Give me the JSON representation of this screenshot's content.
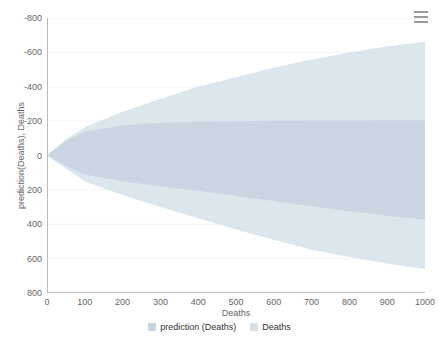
{
  "chart_data": {
    "type": "area",
    "title": "",
    "subtitle": "",
    "xlabel": "Deaths",
    "ylabel": "prediction(Deaths), Deaths",
    "xlim": [
      0,
      1000
    ],
    "ylim": [
      -800,
      800
    ],
    "x_ticks": [
      0,
      100,
      200,
      300,
      400,
      500,
      600,
      700,
      800,
      900,
      1000
    ],
    "y_ticks": [
      -800,
      -600,
      -400,
      -200,
      0,
      200,
      400,
      600,
      800
    ],
    "grid": "horizontal-only",
    "legend_position": "bottom-center",
    "series": [
      {
        "name": "prediction (Deaths)",
        "type": "arearange",
        "color": "#c6d4df",
        "x": [
          0,
          50,
          100,
          200,
          300,
          400,
          500,
          600,
          700,
          800,
          900,
          1000
        ],
        "low": [
          0,
          -60,
          -110,
          -150,
          -180,
          -205,
          -235,
          -265,
          -295,
          -325,
          -350,
          -372
        ],
        "high": [
          0,
          85,
          140,
          175,
          190,
          196,
          200,
          202,
          203,
          204,
          205,
          205
        ]
      },
      {
        "name": "Deaths",
        "type": "arearange",
        "color": "#d6e2ea",
        "x": [
          0,
          50,
          100,
          200,
          300,
          400,
          500,
          600,
          700,
          800,
          900,
          1000
        ],
        "low": [
          0,
          -75,
          -150,
          -230,
          -300,
          -365,
          -430,
          -490,
          -548,
          -590,
          -628,
          -662
        ],
        "high": [
          0,
          95,
          165,
          255,
          330,
          400,
          455,
          510,
          558,
          600,
          635,
          662
        ]
      }
    ]
  },
  "axes": {
    "y_title": "prediction(Deaths), Deaths",
    "x_title": "Deaths",
    "y_tick_labels": [
      "800",
      "600",
      "400",
      "200",
      "0",
      "-200",
      "-400",
      "-600",
      "-800"
    ],
    "x_tick_labels": [
      "0",
      "100",
      "200",
      "300",
      "400",
      "500",
      "600",
      "700",
      "800",
      "900",
      "1000"
    ]
  },
  "legend": {
    "items": [
      {
        "label": "prediction (Deaths)",
        "color": "#c6d4df",
        "icon": "square-swatch-icon"
      },
      {
        "label": "Deaths",
        "color": "#d6e2ea",
        "icon": "square-swatch-icon"
      }
    ]
  },
  "context_menu": {
    "icon": "hamburger-menu-icon",
    "label": "Chart context menu"
  },
  "colors": {
    "background": "#ffffff",
    "axis_line": "#bdbdbd",
    "gridline": "#f2f4f6",
    "tick_text": "#666666",
    "legend_text": "#333333",
    "band_outer": "#d6e2ea",
    "band_inner": "#c6d4df"
  }
}
